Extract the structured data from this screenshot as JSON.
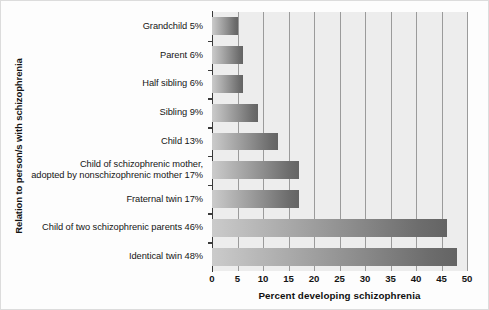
{
  "chart_data": {
    "type": "bar",
    "orientation": "horizontal",
    "title": "",
    "xlabel": "Percent developing schizophrenia",
    "ylabel": "Relation to person/s with schizophrenia",
    "xlim": [
      0,
      50
    ],
    "xticks": [
      0,
      5,
      10,
      15,
      20,
      25,
      30,
      35,
      40,
      45,
      50
    ],
    "xtick_labels": [
      "0",
      "5",
      "10",
      "15",
      "20",
      "25",
      "30",
      "35",
      "40",
      "45",
      "50"
    ],
    "grid": "vertical",
    "legend": "none",
    "categories": [
      "Grandchild 5%",
      "Parent 6%",
      "Half sibling 6%",
      "Sibling 9%",
      "Child 13%",
      "Child of schizophrenic mother, adopted by nonschizophrenic mother 17%",
      "Fraternal twin 17%",
      "Child of two schizophrenic parents 46%",
      "Identical twin 48%"
    ],
    "category_lines": [
      [
        "Grandchild 5%"
      ],
      [
        "Parent 6%"
      ],
      [
        "Half sibling 6%"
      ],
      [
        "Sibling 9%"
      ],
      [
        "Child 13%"
      ],
      [
        "Child of schizophrenic mother,",
        "adopted by nonschizophrenic mother 17%"
      ],
      [
        "Fraternal twin 17%"
      ],
      [
        "Child of two schizophrenic parents 46%"
      ],
      [
        "Identical twin 48%"
      ]
    ],
    "values": [
      5,
      6,
      6,
      9,
      13,
      17,
      17,
      46,
      48
    ],
    "bar_gradient_from": "#cbcbcb",
    "bar_gradient_to": "#646464",
    "plot_background": "#ededed",
    "gridline_color": "#9b9b9b",
    "axis_color": "#3a3a3a"
  }
}
